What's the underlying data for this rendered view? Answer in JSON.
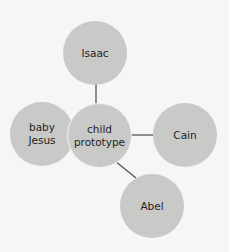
{
  "diagram": {
    "type": "hub-and-spoke",
    "center": {
      "id": "child-prototype",
      "label_lines": [
        "child",
        "prototype"
      ]
    },
    "nodes": [
      {
        "id": "isaac",
        "label_lines": [
          "Isaac"
        ]
      },
      {
        "id": "baby-jesus",
        "label_lines": [
          "baby",
          "Jesus"
        ]
      },
      {
        "id": "cain",
        "label_lines": [
          "Cain"
        ]
      },
      {
        "id": "abel",
        "label_lines": [
          "Abel"
        ]
      }
    ],
    "edges": [
      {
        "from": "child-prototype",
        "to": "isaac"
      },
      {
        "from": "child-prototype",
        "to": "cain"
      },
      {
        "from": "child-prototype",
        "to": "abel"
      },
      {
        "from": "child-prototype",
        "to": "baby-jesus",
        "style": "overlap"
      }
    ],
    "colors": {
      "node_fill": "#c9c9c8",
      "edge": "#555555",
      "background": "#f6f6f5",
      "text": "#1f1f1f"
    }
  }
}
